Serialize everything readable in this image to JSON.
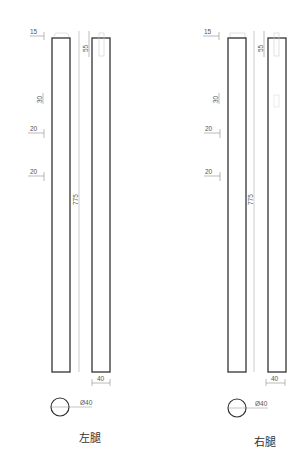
{
  "drawing": {
    "title": "Leg detail drawings",
    "units": "mm",
    "stroke_color": "#333333",
    "dim_color": "#666666",
    "views": [
      {
        "id": "left",
        "caption": "左腿",
        "dims": {
          "top_offset": "15",
          "tenon_length": "55",
          "d1": "30",
          "d2": "20",
          "d3": "20",
          "total_length": "775",
          "width": "40",
          "diameter": "Ø40"
        }
      },
      {
        "id": "right",
        "caption": "右腿",
        "dims": {
          "top_offset": "15",
          "tenon_length": "55",
          "d1": "30",
          "d2": "20",
          "d3": "20",
          "total_length": "775",
          "width": "40",
          "diameter": "Ø40"
        }
      }
    ]
  }
}
